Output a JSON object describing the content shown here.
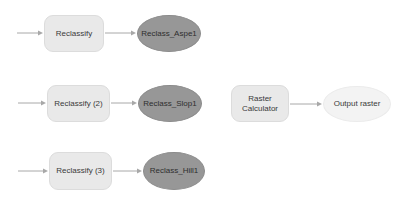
{
  "canvas": {
    "width": 408,
    "height": 213,
    "background": "#ffffff",
    "title": "Model diagram"
  },
  "palette": {
    "tool_fill": "#e9e9e9",
    "tool_stroke": "#dcdcdc",
    "data_dark_fill": "#979797",
    "data_dark_stroke": "#8b8b8b",
    "data_light_fill": "#f3f3f3",
    "data_light_stroke": "#ebebeb",
    "connector": "#a8a8a8",
    "text": "#3a3a3a"
  },
  "nodes": {
    "tool_reclassify_1": {
      "label": "Reclassify",
      "shape": "rounded-rectangle",
      "kind": "tool",
      "x": 44,
      "y": 15,
      "w": 60,
      "h": 37
    },
    "data_reclass_aspe1": {
      "label": "Reclass_Aspe1",
      "shape": "ellipse",
      "kind": "data",
      "x": 137,
      "y": 15,
      "w": 64,
      "h": 37
    },
    "tool_reclassify_2": {
      "label": "Reclassify (2)",
      "shape": "rounded-rectangle",
      "kind": "tool",
      "x": 47,
      "y": 85,
      "w": 63,
      "h": 37
    },
    "data_reclass_slop1": {
      "label": "Reclass_Slop1",
      "shape": "ellipse",
      "kind": "data",
      "x": 138,
      "y": 85,
      "w": 64,
      "h": 37
    },
    "tool_reclassify_3": {
      "label": "Reclassify (3)",
      "shape": "rounded-rectangle",
      "kind": "tool",
      "x": 49,
      "y": 152,
      "w": 63,
      "h": 38
    },
    "data_reclass_hill1": {
      "label": "Reclass_Hill1",
      "shape": "ellipse",
      "kind": "data",
      "x": 143,
      "y": 152,
      "w": 62,
      "h": 38
    },
    "tool_raster_calculator": {
      "label": "Raster\nCalculator",
      "shape": "rounded-rectangle",
      "kind": "tool",
      "x": 231,
      "y": 85,
      "w": 58,
      "h": 37
    },
    "data_output_raster": {
      "label": "Output raster",
      "shape": "ellipse",
      "kind": "data",
      "x": 323,
      "y": 86,
      "w": 68,
      "h": 36
    }
  },
  "connectors": [
    {
      "name": "input-to-reclassify-1",
      "x1": 17,
      "y1": 33,
      "x2": 43,
      "y2": 33
    },
    {
      "name": "reclassify-1-to-reclass-aspe1",
      "x1": 105,
      "y1": 33,
      "x2": 136,
      "y2": 33
    },
    {
      "name": "input-to-reclassify-2",
      "x1": 18,
      "y1": 103,
      "x2": 46,
      "y2": 103
    },
    {
      "name": "reclassify-2-to-reclass-slop1",
      "x1": 111,
      "y1": 103,
      "x2": 137,
      "y2": 103
    },
    {
      "name": "input-to-reclassify-3",
      "x1": 18,
      "y1": 171,
      "x2": 48,
      "y2": 171
    },
    {
      "name": "reclassify-3-to-reclass-hill1",
      "x1": 113,
      "y1": 171,
      "x2": 142,
      "y2": 171
    },
    {
      "name": "raster-calculator-to-output-raster",
      "x1": 290,
      "y1": 104,
      "x2": 322,
      "y2": 104
    }
  ]
}
